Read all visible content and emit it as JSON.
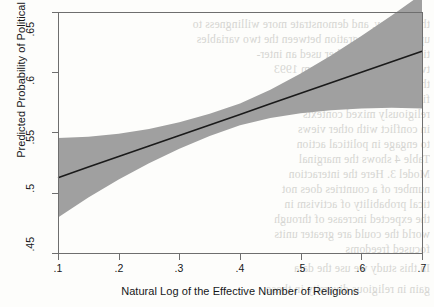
{
  "figure": {
    "background_color": "#fdfdfb",
    "frame_color": "#6e6e6e",
    "band_color": "#a0a0a0",
    "line_color": "#1a1a1a",
    "text_color": "#17181a"
  },
  "chart_data": {
    "type": "line",
    "title": "",
    "subtitle": "",
    "xlabel": "Natural Log of the Effective Number of Religions",
    "ylabel": "Predicted Probability of Political Activism",
    "xlim": [
      0.1,
      0.7
    ],
    "ylim": [
      0.45,
      0.65
    ],
    "xticks": [
      0.1,
      0.2,
      0.3,
      0.4,
      0.5,
      0.6,
      0.7
    ],
    "xtick_labels": [
      ".1",
      ".2",
      ".3",
      ".4",
      ".5",
      ".6",
      ".7"
    ],
    "yticks": [
      0.45,
      0.5,
      0.55,
      0.6,
      0.65
    ],
    "ytick_labels": [
      ".45",
      ".5",
      ".55",
      ".6",
      ".65"
    ],
    "grid": false,
    "legend": "none",
    "x": [
      0.1,
      0.15,
      0.2,
      0.25,
      0.3,
      0.35,
      0.4,
      0.45,
      0.5,
      0.55,
      0.6,
      0.65,
      0.7
    ],
    "series": [
      {
        "name": "Predicted probability",
        "role": "fit-line",
        "values": [
          0.5125,
          0.5213,
          0.53,
          0.5388,
          0.5475,
          0.5563,
          0.565,
          0.5738,
          0.5825,
          0.5913,
          0.6,
          0.6088,
          0.6175
        ]
      },
      {
        "name": "95% confidence interval upper bound",
        "role": "ci-upper",
        "values": [
          0.5455,
          0.5465,
          0.549,
          0.553,
          0.5585,
          0.5655,
          0.574,
          0.5855,
          0.599,
          0.614,
          0.63,
          0.647,
          0.665
        ]
      },
      {
        "name": "95% confidence interval lower bound",
        "role": "ci-lower",
        "values": [
          0.4795,
          0.496,
          0.511,
          0.5245,
          0.5365,
          0.547,
          0.556,
          0.562,
          0.566,
          0.5685,
          0.57,
          0.5705,
          0.57
        ]
      }
    ],
    "annotations": []
  },
  "scan_artifacts": {
    "note": "faint mirrored bleed-through text from reverse of scanned page",
    "lines": [
      "that display, and demonstrate more willingness to",
      "up with an integration between the two variables",
      "tions. Model 3 further used an inter-",
      "two composite of Activism 1993",
      "the results on the first model",
      "findings in religious diversity",
      "religiously mixed contexts",
      "in conflict with other views",
      "to engage in political action",
      "Table 4 shows the marginal",
      "Model 3. Here the interaction",
      "number of a countries does not",
      "tical probability of activism in",
      "the expected increase of through",
      "world the could are greater units",
      "focused freedoms",
      "In this study we use the data",
      "gain in religious diversity in those"
    ]
  }
}
